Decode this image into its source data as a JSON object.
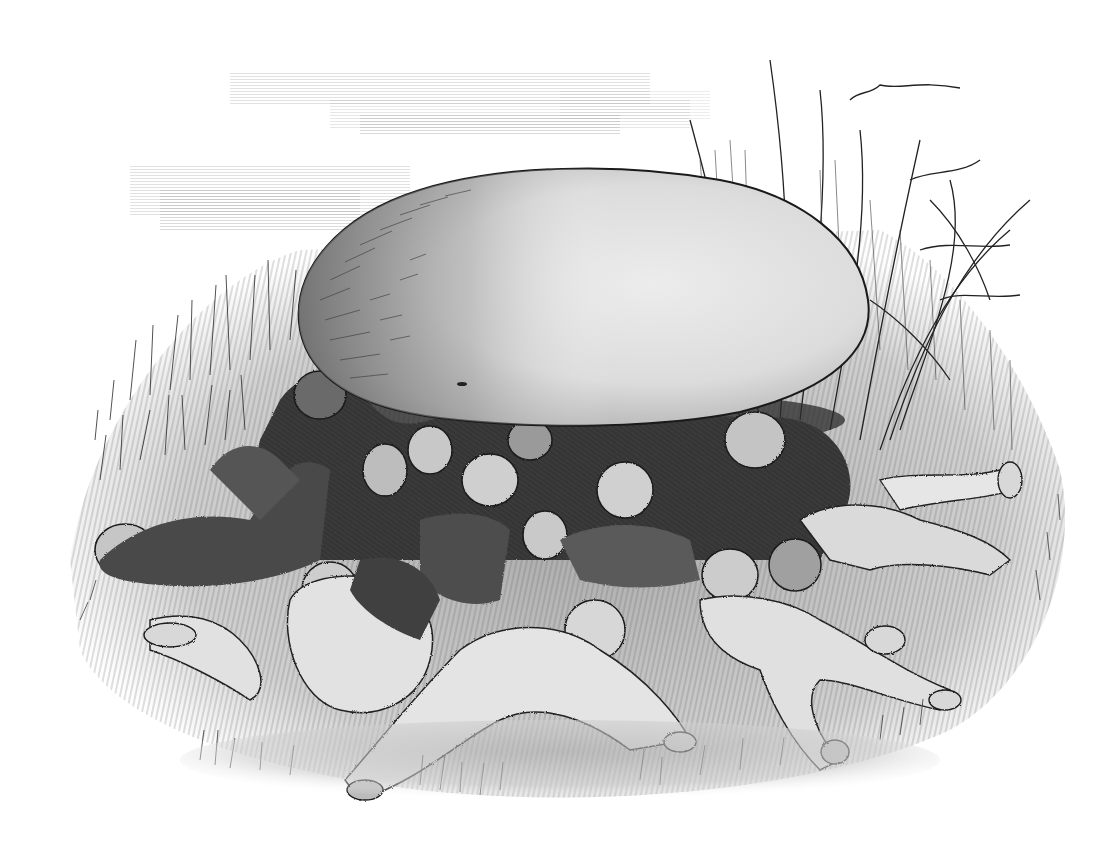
{
  "image": {
    "kind": "engraving-illustration",
    "style": "monochrome wood engraving",
    "subject": "Children sleeping under a giant mushroom",
    "caption": "",
    "colors": {
      "paper": "#ffffff",
      "ink": "#1a1a1a",
      "dark": "#3a3a3a",
      "mid": "#7a7a7a",
      "light": "#bdbdbd",
      "pale": "#dedede",
      "cap_highlight": "#e9e9e9",
      "cap_shadow": "#8c8c8c"
    },
    "elements": {
      "sky": {
        "label": "streaky cloud hatching",
        "position": "upper-left"
      },
      "mushroom_cap": {
        "label": "giant mushroom cap",
        "cx": 585,
        "cy": 300,
        "rx": 285,
        "ry": 125
      },
      "reeds": {
        "label": "tall reeds and grass",
        "position": "right"
      },
      "grass_bank": {
        "label": "grassy hillock",
        "position": "left"
      },
      "figures": {
        "label": "group of sleeping children",
        "count_approx": 14
      },
      "ground": {
        "label": "grass foreground",
        "position": "bottom"
      }
    }
  }
}
